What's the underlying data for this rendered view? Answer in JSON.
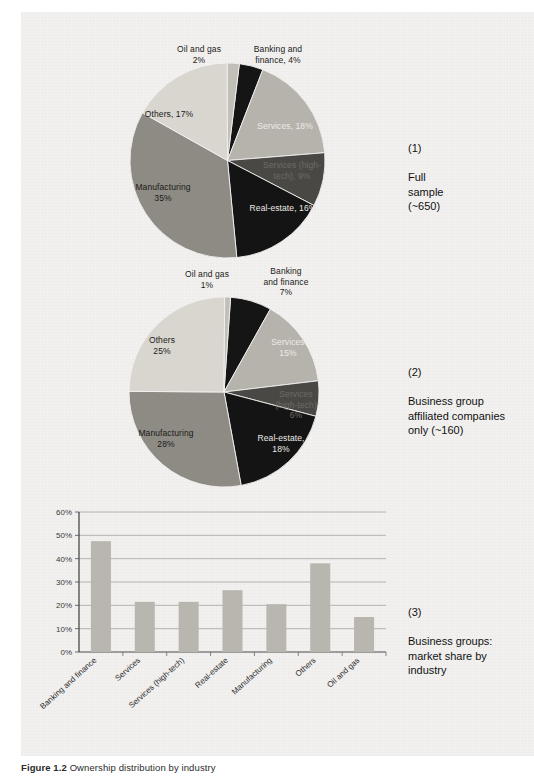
{
  "figure": {
    "caption_label": "Figure 1.2",
    "caption_text": "Ownership distribution by industry"
  },
  "annotations": [
    {
      "number": "(1)",
      "text": "Full\nsample\n(~650)"
    },
    {
      "number": "(2)",
      "text": "Business group\naffiliated companies\nonly (~160)"
    },
    {
      "number": "(3)",
      "text": "Business groups:\nmarket share by\nindustry"
    }
  ],
  "chart_data": [
    {
      "type": "pie",
      "title": "Full sample (~650)",
      "index": "(1)",
      "categories": [
        "Banking and finance",
        "Services",
        "Services (high-tech)",
        "Real-estate",
        "Manufacturing",
        "Others",
        "Oil and gas"
      ],
      "values": [
        4,
        18,
        9,
        16,
        35,
        17,
        2
      ],
      "labels": [
        "Banking and\nfinance, 4%",
        "Services, 18%",
        "Services (high-\ntech), 9%",
        "Real-estate, 16%",
        "Manufacturing\n35%",
        "Others, 17%",
        "Oil and gas\n2%"
      ],
      "colors": [
        "#151515",
        "#b6b3ac",
        "#4a4845",
        "#141414",
        "#8e8b84",
        "#d9d6d0",
        "#c2bfb8"
      ],
      "legend": "none"
    },
    {
      "type": "pie",
      "title": "Business group affiliated companies only (~160)",
      "index": "(2)",
      "categories": [
        "Banking and finance",
        "Services",
        "Services (high-tech)",
        "Real-estate",
        "Manufacturing",
        "Others",
        "Oil and gas"
      ],
      "values": [
        7,
        15,
        6,
        18,
        28,
        25,
        1
      ],
      "labels": [
        "Banking\nand finance\n7%",
        "Services\n15%",
        "Services\n(high-tech)\n6%",
        "Real-estate,\n18%",
        "Manufacturing\n28%",
        "Others\n25%",
        "Oil and gas\n1%"
      ],
      "colors": [
        "#151515",
        "#b6b3ac",
        "#4a4845",
        "#141414",
        "#8e8b84",
        "#d9d6d0",
        "#c2bfb8"
      ],
      "legend": "none"
    },
    {
      "type": "bar",
      "title": "Business groups: market share by industry",
      "index": "(3)",
      "categories": [
        "Banking and finance",
        "Services",
        "Services (high-tech)",
        "Real-estate",
        "Manufacturing",
        "Others",
        "Oil and gas"
      ],
      "values": [
        47.5,
        21.5,
        21.5,
        26.5,
        20.5,
        38,
        15
      ],
      "ytick_labels": [
        "0%",
        "10%",
        "20%",
        "30%",
        "40%",
        "50%",
        "60%"
      ],
      "yticks": [
        0,
        10,
        20,
        30,
        40,
        50,
        60
      ],
      "ylim": [
        0,
        60
      ],
      "xlabel": "",
      "ylabel": "",
      "grid": true,
      "bar_color": "#b9b6b0"
    }
  ]
}
